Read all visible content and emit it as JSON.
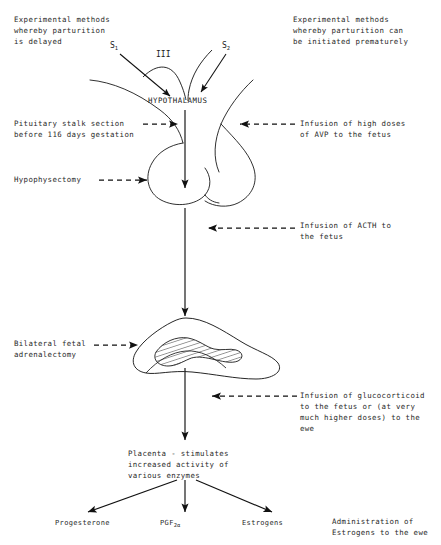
{
  "figure": {
    "type": "flow-diagram"
  },
  "headers": {
    "left": "Experimental methods\nwhereby parturition\nis delayed",
    "right": "Experimental methods\nwhereby parturition can\nbe initiated prematurely"
  },
  "stimuli": {
    "s1_label": "S",
    "s1_sub": "1",
    "s2_label": "S",
    "s2_sub": "2",
    "ventricle": "III"
  },
  "organs": {
    "hypothalamus": "HYPOTHALAMUS",
    "placenta": "Placenta - stimulates\nincreased activity of\nvarious enzymes"
  },
  "left_interventions": [
    {
      "name": "pituitary-stalk-section",
      "text": "Pituitary stalk section\nbefore 116 days gestation"
    },
    {
      "name": "hypophysectomy",
      "text": "Hypophysectomy"
    },
    {
      "name": "bilateral-fetal-adrenalectomy",
      "text": "Bilateral fetal\nadrenalectomy"
    }
  ],
  "right_interventions": [
    {
      "name": "avp-infusion",
      "text": "Infusion of high doses\nof AVP to the fetus"
    },
    {
      "name": "acth-infusion",
      "text": "Infusion of ACTH to\nthe fetus"
    },
    {
      "name": "glucocorticoid-infusion",
      "text": "Infusion of glucocorticoid\nto the fetus or (at very\nmuch higher doses) to the\newe"
    },
    {
      "name": "estrogen-administration",
      "text": "Administration of\nEstrogens to the ewe"
    }
  ],
  "outputs": [
    {
      "name": "progesterone",
      "label": "Progesterone",
      "sub": ""
    },
    {
      "name": "pgf2alpha",
      "label": "PGF",
      "sub": "2α"
    },
    {
      "name": "estrogens",
      "label": "Estrogens",
      "sub": ""
    }
  ],
  "colors": {
    "ink": "#1a1a1a",
    "text": "#2a2a2a",
    "background": "#ffffff"
  }
}
